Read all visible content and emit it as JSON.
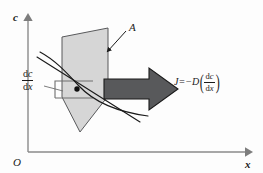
{
  "figure": {
    "title": "Diffusion flux through a plane of area A",
    "background_color": "#fdfdfd"
  },
  "axes": {
    "vertical": {
      "label": "c",
      "name": "concentration-axis",
      "arrow": true
    },
    "horizontal": {
      "label": "x",
      "name": "position-axis",
      "arrow": true
    },
    "origin": {
      "label": "O"
    }
  },
  "annotations": {
    "area_label": "A",
    "gradient": {
      "numerator_d": "d",
      "numerator_var": "c",
      "denominator_d": "d",
      "denominator_var": "x"
    },
    "flux_equation": {
      "lead": "J=−D",
      "paren_open": "(",
      "paren_close": ")",
      "numerator_d": "d",
      "numerator_var": "c",
      "denominator_d": "d",
      "denominator_var": "x",
      "plain_text": "J = −D (dc/dx)"
    }
  },
  "colors": {
    "plane_fill": "#d6d6d6",
    "plane_stroke": "#4a4a4a",
    "arrow_fill": "#58595b",
    "arrow_stroke": "#1a1a1a",
    "axis_stroke": "#8a8a8a",
    "curve_stroke": "#1a1a1a",
    "tangent_stroke": "#1a1a1a",
    "slope_box_stroke": "#6e6e6e",
    "text": "#1a1a1a"
  },
  "shapes": {
    "plane": {
      "name": "diffusion-plane",
      "points": "80,132 62,97 62,37 108,28 108,96 80,132",
      "description": "light gray quadrilateral representing plane of area A"
    },
    "flux_arrow": {
      "name": "flux-arrow",
      "points": "104,79 150,79 150,69 178,89 150,109 150,99 104,99",
      "direction": "right"
    },
    "concentration_curve": {
      "name": "concentration-curve",
      "path": "M 39,52 C 58,62 72,78 90,92 C 107,105 127,112 152,115"
    },
    "tangent_line": {
      "name": "tangent-line",
      "path": "M 37,58 L 141,122"
    },
    "tangent_point": {
      "name": "tangent-point-marker",
      "cx": 77,
      "cy": 89,
      "r": 2.6
    },
    "slope_box": {
      "name": "slope-reference-box",
      "points": "55,97 55,81 92,81"
    },
    "area_leader": {
      "name": "area-leader-arrow",
      "path": "M 124,32 L 106,51"
    },
    "gradient_leader": {
      "name": "gradient-leader-line",
      "path": "M 45,86 L 63,90"
    }
  }
}
